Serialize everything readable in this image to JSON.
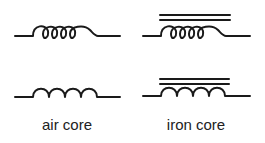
{
  "diagram": {
    "stroke_color": "#1a1a1a",
    "symbols": [
      {
        "name": "air-core-inductor-looped",
        "core": "air",
        "style": "looped"
      },
      {
        "name": "iron-core-inductor-looped",
        "core": "iron",
        "style": "looped"
      },
      {
        "name": "air-core-inductor-arcs",
        "core": "air",
        "style": "arcs"
      },
      {
        "name": "iron-core-inductor-arcs",
        "core": "iron",
        "style": "arcs"
      }
    ],
    "labels": {
      "air": "air core",
      "iron": "iron core"
    }
  }
}
